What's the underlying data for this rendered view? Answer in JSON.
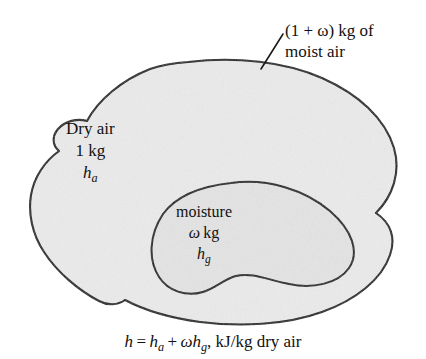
{
  "figure": {
    "colors": {
      "outline": "#1a1a1a",
      "fill": "#ebebeb",
      "inner_fill": "#e4e4e4",
      "background": "#ffffff",
      "text": "#111111"
    },
    "callout": {
      "line1": "(1 + ω) kg of",
      "line2": "moist air",
      "leader_from_x": 283,
      "leader_from_y": 34,
      "leader_to_x": 261,
      "leader_to_y": 69
    },
    "dry_air": {
      "line1": "Dry air",
      "line2": "1 kg",
      "symbol_base": "h",
      "symbol_sub": "a"
    },
    "moisture": {
      "line1": "moisture",
      "line2_omega": "ω",
      "line2_unit": "kg",
      "symbol_base": "h",
      "symbol_sub": "g"
    },
    "caption": {
      "h": "h",
      "equals": "=",
      "ha_base": "h",
      "ha_sub": "a",
      "plus": "+",
      "omega": "ω",
      "hg_base": "h",
      "hg_sub": "g",
      "units": ", kJ/kg dry air"
    }
  }
}
